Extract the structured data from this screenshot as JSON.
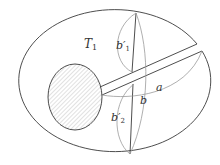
{
  "diagram": {
    "type": "topology-figure",
    "colors": {
      "outline": "#3a3a3a",
      "gray_curve": "#9a9a9a",
      "hatch": "#b5b5b5",
      "background": "#ffffff"
    },
    "labels": {
      "region": {
        "main": "T",
        "sub": "1"
      },
      "b1": {
        "main": "b′",
        "sub": "1"
      },
      "b2": {
        "main": "b′",
        "sub": "2"
      },
      "b": {
        "main": "b"
      },
      "a": {
        "main": "a"
      }
    }
  }
}
